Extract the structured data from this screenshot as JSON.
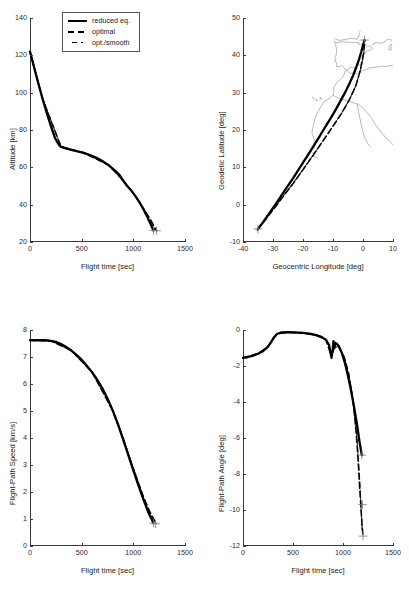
{
  "figure": {
    "background": "#ffffff",
    "series_colors": {
      "reduced_eq": "#000000",
      "optimal": "#000000",
      "opt_smooth": "#444444",
      "coastline": "#808080"
    }
  },
  "legend": {
    "position": "top-left-panel",
    "entries": [
      {
        "label": "reduced eq.",
        "style": "solid",
        "key": "reduced_eq"
      },
      {
        "label": "optimal",
        "style": "dashed",
        "key": "optimal"
      },
      {
        "label": "opt./smooth",
        "style": "dash-dot",
        "key": "opt_smooth"
      }
    ]
  },
  "chart_data": [
    {
      "id": "altitude",
      "type": "line",
      "title": "",
      "xlabel": "Flight time [sec]",
      "ylabel": "Altitude [km]",
      "xlim": [
        0,
        1500
      ],
      "ylim": [
        20,
        140
      ],
      "xticks": [
        0,
        500,
        1000,
        1500
      ],
      "yticks": [
        20,
        40,
        60,
        80,
        100,
        120,
        140
      ],
      "grid": false,
      "series": [
        {
          "name": "reduced eq.",
          "style": "solid",
          "x": [
            0,
            40,
            80,
            120,
            160,
            200,
            240,
            280,
            300,
            340,
            400,
            460,
            520,
            580,
            640,
            700,
            760,
            820,
            860,
            900,
            940,
            980,
            1020,
            1060,
            1100,
            1140,
            1170,
            1195
          ],
          "y": [
            122.0,
            113.5,
            105.0,
            97.0,
            89.5,
            82.5,
            76.0,
            72.0,
            71.0,
            70.3,
            69.4,
            68.6,
            67.7,
            66.6,
            65.2,
            63.4,
            61.2,
            58.4,
            56.3,
            53.0,
            50.0,
            47.6,
            44.6,
            41.2,
            37.3,
            32.8,
            29.2,
            26.2
          ]
        },
        {
          "name": "optimal",
          "style": "dashed",
          "x": [
            0,
            120,
            300,
            520,
            760,
            900,
            1020,
            1100,
            1160,
            1200,
            1225
          ],
          "y": [
            122.0,
            97.0,
            71.0,
            67.7,
            61.2,
            53.0,
            44.6,
            37.8,
            32.5,
            28.5,
            26.0
          ]
        },
        {
          "name": "opt./smooth",
          "style": "dash-dot",
          "x": [
            0,
            120,
            300,
            520,
            760,
            900,
            1020,
            1100,
            1160,
            1205
          ],
          "y": [
            122.0,
            97.0,
            71.2,
            67.9,
            61.4,
            53.2,
            44.8,
            37.5,
            32.0,
            26.5
          ]
        }
      ],
      "endpoint_markers": [
        {
          "x": 1195,
          "y": 26.2
        },
        {
          "x": 1225,
          "y": 26.0
        }
      ]
    },
    {
      "id": "ground-track",
      "type": "line",
      "title": "",
      "xlabel": "Geocentric Longitude [deg]",
      "ylabel": "Geodetic Latitude [deg]",
      "xlim": [
        -40,
        10
      ],
      "ylim": [
        -10,
        50
      ],
      "xticks": [
        -40,
        -30,
        -20,
        -10,
        0,
        10
      ],
      "yticks": [
        -10,
        0,
        10,
        20,
        30,
        40,
        50
      ],
      "grid": false,
      "series": [
        {
          "name": "reduced eq.",
          "style": "solid",
          "x": [
            -35.0,
            -33.6,
            -32.2,
            -30.8,
            -29.4,
            -28.0,
            -26.5,
            -25.0,
            -23.4,
            -21.8,
            -20.2,
            -18.6,
            -17.0,
            -15.4,
            -13.8,
            -12.2,
            -10.6,
            -9.0,
            -7.5,
            -6.0,
            -4.6,
            -3.3,
            -2.2,
            -1.3,
            -0.6,
            -0.1,
            0.3,
            0.5
          ],
          "y": [
            -6.5,
            -5.0,
            -3.4,
            -1.8,
            -0.2,
            1.5,
            3.3,
            5.1,
            7.0,
            9.0,
            11.0,
            13.0,
            15.0,
            17.1,
            19.2,
            21.3,
            23.4,
            25.6,
            27.8,
            30.0,
            32.3,
            34.6,
            36.9,
            39.0,
            40.9,
            42.4,
            43.5,
            44.1
          ]
        },
        {
          "name": "optimal",
          "style": "dashed",
          "x": [
            -35.2,
            -32.4,
            -29.6,
            -26.8,
            -24.0,
            -21.2,
            -18.4,
            -15.6,
            -12.8,
            -10.0,
            -7.2,
            -4.6,
            -2.4,
            -0.9,
            0.2,
            0.6
          ],
          "y": [
            -6.8,
            -3.9,
            -1.0,
            2.0,
            4.9,
            8.0,
            11.2,
            14.4,
            17.7,
            21.0,
            24.4,
            28.0,
            31.8,
            36.0,
            40.5,
            44.0
          ]
        },
        {
          "name": "opt./smooth",
          "style": "dash-dot",
          "x": [
            -35.1,
            -32.3,
            -29.5,
            -26.7,
            -23.9,
            -21.1,
            -18.3,
            -15.5,
            -12.7,
            -9.9,
            -7.1,
            -4.5,
            -2.3,
            -0.8,
            0.3,
            0.6
          ],
          "y": [
            -6.6,
            -3.7,
            -0.8,
            2.2,
            5.1,
            8.2,
            11.4,
            14.6,
            17.9,
            21.2,
            24.6,
            28.2,
            32.0,
            36.2,
            40.7,
            44.1
          ]
        }
      ],
      "endpoint_markers": [
        {
          "x": -35.0,
          "y": -6.5
        },
        {
          "x": 0.5,
          "y": 44.1
        }
      ],
      "coastline_note": "Iberian Peninsula and NW African coastline outline"
    },
    {
      "id": "speed",
      "type": "line",
      "title": "",
      "xlabel": "Flight time [sec]",
      "ylabel": "Flight-Path Speed [km/s]",
      "xlim": [
        0,
        1500
      ],
      "ylim": [
        0,
        8
      ],
      "xticks": [
        0,
        500,
        1000,
        1500
      ],
      "yticks": [
        0,
        1,
        2,
        3,
        4,
        5,
        6,
        7,
        8
      ],
      "grid": false,
      "series": [
        {
          "name": "reduced eq.",
          "style": "solid",
          "x": [
            0,
            50,
            100,
            150,
            200,
            250,
            300,
            350,
            400,
            450,
            500,
            550,
            600,
            650,
            700,
            750,
            800,
            850,
            900,
            950,
            1000,
            1050,
            1100,
            1150,
            1195
          ],
          "y": [
            7.62,
            7.62,
            7.62,
            7.62,
            7.6,
            7.56,
            7.48,
            7.37,
            7.24,
            7.08,
            6.9,
            6.68,
            6.44,
            6.16,
            5.84,
            5.46,
            5.02,
            4.52,
            3.96,
            3.38,
            2.8,
            2.24,
            1.7,
            1.2,
            0.85
          ]
        },
        {
          "name": "optimal",
          "style": "dashed",
          "x": [
            0,
            200,
            400,
            600,
            800,
            900,
            1000,
            1100,
            1160,
            1215
          ],
          "y": [
            7.62,
            7.6,
            7.24,
            6.44,
            5.02,
            4.0,
            2.86,
            1.8,
            1.26,
            0.88
          ]
        },
        {
          "name": "opt./smooth",
          "style": "dash-dot",
          "x": [
            0,
            200,
            400,
            600,
            800,
            900,
            1000,
            1100,
            1160,
            1205
          ],
          "y": [
            7.62,
            7.6,
            7.25,
            6.45,
            5.04,
            4.02,
            2.88,
            1.78,
            1.22,
            0.86
          ]
        }
      ],
      "endpoint_markers": [
        {
          "x": 1195,
          "y": 0.85
        },
        {
          "x": 1215,
          "y": 0.82
        }
      ]
    },
    {
      "id": "flight-path-angle",
      "type": "line",
      "title": "",
      "xlabel": "Flight time [sec]",
      "ylabel": "Flight-Path Angle [deg]",
      "xlim": [
        0,
        1500
      ],
      "ylim": [
        -12,
        0
      ],
      "xticks": [
        0,
        500,
        1000,
        1500
      ],
      "yticks": [
        -12,
        -10,
        -8,
        -6,
        -4,
        -2,
        0
      ],
      "grid": false,
      "series": [
        {
          "name": "reduced eq.",
          "style": "solid",
          "x": [
            0,
            50,
            100,
            150,
            200,
            250,
            280,
            310,
            340,
            380,
            450,
            520,
            600,
            680,
            740,
            790,
            830,
            860,
            875,
            885,
            895,
            905,
            915,
            925,
            940,
            960,
            990,
            1020,
            1050,
            1080,
            1110,
            1140,
            1165,
            1188
          ],
          "y": [
            -1.55,
            -1.5,
            -1.42,
            -1.32,
            -1.18,
            -0.92,
            -0.68,
            -0.4,
            -0.22,
            -0.14,
            -0.12,
            -0.13,
            -0.16,
            -0.22,
            -0.3,
            -0.4,
            -0.55,
            -0.82,
            -1.25,
            -1.55,
            -1.2,
            -0.62,
            -0.95,
            -0.72,
            -0.78,
            -0.92,
            -1.3,
            -1.85,
            -2.55,
            -3.35,
            -4.25,
            -5.25,
            -6.2,
            -6.95
          ]
        },
        {
          "name": "optimal",
          "style": "dashed",
          "x": [
            0,
            150,
            250,
            340,
            450,
            600,
            740,
            830,
            875,
            895,
            915,
            960,
            1010,
            1050,
            1080,
            1105,
            1125,
            1140,
            1155,
            1168,
            1180,
            1190,
            1200
          ],
          "y": [
            -1.55,
            -1.32,
            -0.92,
            -0.22,
            -0.14,
            -0.18,
            -0.3,
            -0.55,
            -1.3,
            -1.25,
            -0.98,
            -0.95,
            -1.5,
            -2.3,
            -3.2,
            -4.2,
            -5.3,
            -6.3,
            -7.6,
            -8.9,
            -9.9,
            -10.8,
            -11.45
          ]
        },
        {
          "name": "opt./smooth",
          "style": "dash-dot",
          "x": [
            0,
            150,
            250,
            340,
            450,
            600,
            740,
            830,
            875,
            900,
            950,
            1010,
            1060,
            1100,
            1140,
            1170,
            1192
          ],
          "y": [
            -1.55,
            -1.3,
            -0.9,
            -0.2,
            -0.13,
            -0.17,
            -0.28,
            -0.52,
            -1.22,
            -1.05,
            -0.9,
            -1.45,
            -2.45,
            -3.95,
            -6.0,
            -8.6,
            -11.2
          ]
        }
      ],
      "endpoint_markers": [
        {
          "x": 1188,
          "y": -6.95
        },
        {
          "x": 1200,
          "y": -11.45
        },
        {
          "x": 1195,
          "y": -9.7
        }
      ]
    }
  ]
}
